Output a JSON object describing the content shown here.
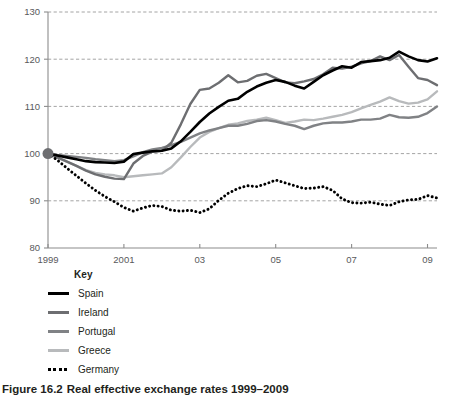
{
  "caption": {
    "figure_number": "Figure 16.2",
    "title": "Real effective exchange rates 1999–2009"
  },
  "legend": {
    "title": "Key",
    "items": [
      {
        "label": "Spain",
        "color": "#000000",
        "style": "solid"
      },
      {
        "label": "Ireland",
        "color": "#6d6e71",
        "style": "solid"
      },
      {
        "label": "Portugal",
        "color": "#808285",
        "style": "solid"
      },
      {
        "label": "Greece",
        "color": "#b8babc",
        "style": "solid"
      },
      {
        "label": "Germany",
        "color": "#000000",
        "style": "dotted"
      }
    ]
  },
  "axes": {
    "y_ticks": [
      "80",
      "90",
      "100",
      "110",
      "120",
      "130"
    ],
    "x_ticks": [
      "1999",
      "2001",
      "03",
      "05",
      "07",
      "09"
    ],
    "ylim": [
      80,
      130
    ],
    "xlim": [
      1999,
      2009.25
    ],
    "gridlines": true,
    "axis_color": "#8c8c8c",
    "grid_color": "#9a9a9a"
  },
  "origin_marker": {
    "x": 1999.0,
    "y": 100,
    "color": "#6d6e71",
    "radius": 5.5
  },
  "chart_data": {
    "type": "line",
    "title": "Real effective exchange rates 1999–2009",
    "xlabel": "",
    "ylabel": "",
    "ylim": [
      80,
      130
    ],
    "xlim": [
      1999,
      2009.25
    ],
    "x_tick_labels": [
      "1999",
      "2001",
      "03",
      "05",
      "07",
      "09"
    ],
    "x_tick_values": [
      1999,
      2001,
      2003,
      2005,
      2007,
      2009
    ],
    "y_tick_values": [
      80,
      90,
      100,
      110,
      120,
      130
    ],
    "grid": true,
    "legend_position": "below-left",
    "note": "Index 1999 = 100. Quarterly observations.",
    "x": [
      1999.0,
      1999.25,
      1999.5,
      1999.75,
      2000.0,
      2000.25,
      2000.5,
      2000.75,
      2001.0,
      2001.25,
      2001.5,
      2001.75,
      2002.0,
      2002.25,
      2002.5,
      2002.75,
      2003.0,
      2003.25,
      2003.5,
      2003.75,
      2004.0,
      2004.25,
      2004.5,
      2004.75,
      2005.0,
      2005.25,
      2005.5,
      2005.75,
      2006.0,
      2006.25,
      2006.5,
      2006.75,
      2007.0,
      2007.25,
      2007.5,
      2007.75,
      2008.0,
      2008.25,
      2008.5,
      2008.75,
      2009.0,
      2009.25
    ],
    "series": [
      {
        "name": "Spain",
        "color": "#000000",
        "style": "solid",
        "width": 2.6,
        "values": [
          100.0,
          99.6,
          99.2,
          98.8,
          98.4,
          98.2,
          98.1,
          98.0,
          98.3,
          99.9,
          100.2,
          100.5,
          100.6,
          101.1,
          102.6,
          104.6,
          106.7,
          108.5,
          109.9,
          111.2,
          111.6,
          113.1,
          114.2,
          115.0,
          115.6,
          115.2,
          114.4,
          113.8,
          115.2,
          116.6,
          117.6,
          118.5,
          118.2,
          119.4,
          119.6,
          119.8,
          120.3,
          121.6,
          120.6,
          119.8,
          119.5,
          120.2
        ]
      },
      {
        "name": "Ireland",
        "color": "#6d6e71",
        "style": "solid",
        "width": 2.4,
        "values": [
          100.0,
          99.2,
          98.3,
          97.4,
          96.4,
          95.6,
          95.1,
          94.7,
          94.6,
          97.9,
          99.5,
          100.4,
          100.6,
          102.3,
          106.2,
          110.5,
          113.5,
          113.8,
          115.0,
          116.6,
          115.1,
          115.4,
          116.5,
          116.9,
          116.0,
          115.1,
          114.9,
          115.3,
          115.8,
          116.8,
          118.2,
          118.0,
          118.4,
          119.1,
          119.6,
          120.6,
          119.8,
          120.9,
          118.4,
          116.0,
          115.6,
          114.5
        ]
      },
      {
        "name": "Portugal",
        "color": "#808285",
        "style": "solid",
        "width": 2.4,
        "values": [
          100.0,
          99.7,
          99.5,
          99.3,
          99.1,
          98.8,
          98.6,
          98.4,
          98.6,
          99.4,
          100.3,
          100.9,
          101.2,
          101.8,
          102.5,
          103.4,
          104.3,
          104.9,
          105.4,
          105.9,
          105.9,
          106.3,
          106.9,
          107.1,
          106.8,
          106.3,
          105.9,
          105.2,
          105.9,
          106.4,
          106.6,
          106.6,
          106.8,
          107.2,
          107.2,
          107.4,
          108.2,
          107.7,
          107.6,
          107.8,
          108.6,
          110.0
        ]
      },
      {
        "name": "Greece",
        "color": "#b8babc",
        "style": "solid",
        "width": 2.4,
        "values": [
          100.0,
          99.1,
          98.3,
          97.4,
          96.5,
          95.9,
          95.6,
          95.4,
          95.0,
          95.2,
          95.4,
          95.6,
          95.8,
          97.1,
          99.2,
          101.4,
          103.4,
          104.6,
          105.4,
          106.1,
          106.4,
          106.9,
          107.2,
          107.6,
          107.1,
          106.5,
          106.8,
          107.2,
          107.1,
          107.4,
          107.8,
          108.2,
          108.8,
          109.6,
          110.3,
          111.0,
          111.9,
          111.1,
          110.6,
          110.8,
          111.5,
          113.2
        ]
      },
      {
        "name": "Germany",
        "color": "#000000",
        "style": "dotted",
        "width": 2.6,
        "values": [
          100.0,
          98.6,
          96.9,
          95.3,
          93.7,
          92.2,
          90.9,
          89.8,
          88.6,
          87.8,
          88.5,
          89.0,
          88.8,
          88.0,
          87.8,
          88.0,
          87.5,
          88.3,
          90.1,
          91.6,
          92.6,
          93.2,
          93.0,
          93.6,
          94.4,
          93.8,
          93.2,
          92.6,
          92.7,
          93.0,
          92.2,
          90.4,
          89.6,
          89.5,
          89.7,
          89.3,
          89.0,
          89.8,
          90.2,
          90.3,
          91.1,
          90.6
        ]
      }
    ]
  }
}
